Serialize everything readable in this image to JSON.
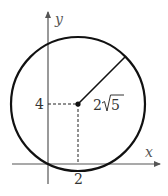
{
  "figure": {
    "type": "circle-on-coordinate-plane",
    "axes": {
      "x_label": "x",
      "y_label": "y"
    },
    "circle": {
      "center": [
        2,
        4
      ],
      "radius_label": "2√5",
      "radius_value_text": "2",
      "radius_sqrt_text": "5",
      "passes_through_origin": true
    },
    "ticks": {
      "x_tick_label": "2",
      "y_tick_label": "4"
    },
    "colors": {
      "stroke": "#111111",
      "axis": "#555555",
      "text": "#333333"
    }
  }
}
